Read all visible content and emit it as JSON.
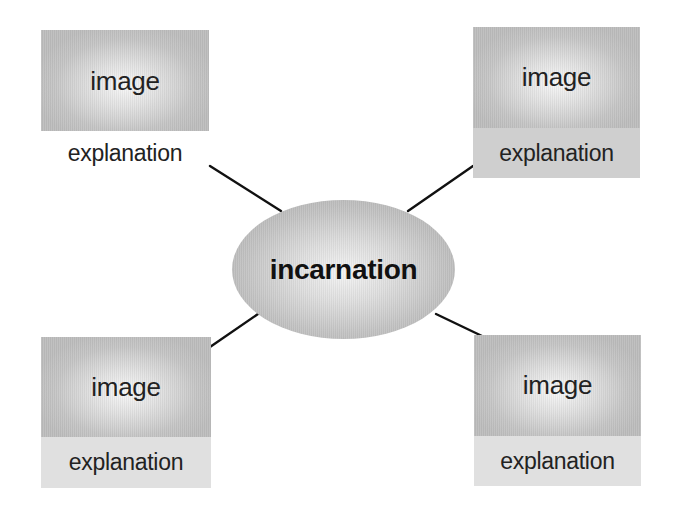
{
  "diagram": {
    "type": "hub-and-spoke",
    "center": {
      "label": "incarnation"
    },
    "nodes": [
      {
        "position": "top-left",
        "image_label": "image",
        "explanation": "explanation"
      },
      {
        "position": "top-right",
        "image_label": "image",
        "explanation": "explanation"
      },
      {
        "position": "bottom-left",
        "image_label": "image",
        "explanation": "explanation"
      },
      {
        "position": "bottom-right",
        "image_label": "image",
        "explanation": "explanation"
      }
    ],
    "colors": {
      "background": "#ffffff",
      "node_fill": "#c6c6c6",
      "node_highlight": "#f7f7f7",
      "explanation_fill": "#cfcfcf",
      "connector": "#111111",
      "text": "#222222"
    }
  }
}
